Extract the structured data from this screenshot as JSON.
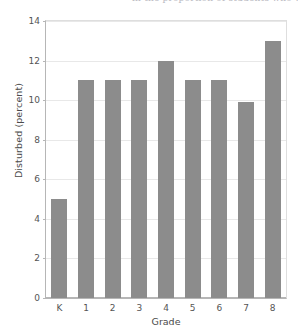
{
  "caption": {
    "text": "in the proportion of students who were disturbed by other students"
  },
  "chart_data": {
    "type": "bar",
    "title": "",
    "categories": [
      "K",
      "1",
      "2",
      "3",
      "4",
      "5",
      "6",
      "7",
      "8"
    ],
    "values": [
      5,
      11,
      11,
      11,
      12,
      11,
      11,
      9.9,
      13
    ],
    "xlabel": "Grade",
    "ylabel": "Disturbed (percent)",
    "ylim": [
      0,
      14
    ],
    "yticks": [
      0,
      2,
      4,
      6,
      8,
      10,
      12,
      14
    ],
    "ytick_labels": [
      "0",
      "2",
      "4",
      "6",
      "8",
      "10",
      "12",
      "14"
    ],
    "grid": true,
    "grid_axis": "y",
    "legend": false,
    "bar_color": "#8c8c8c",
    "background_color": "#ffffff",
    "gridline_color": "#e8e8e8",
    "axis_color": "#b6b6b6"
  }
}
